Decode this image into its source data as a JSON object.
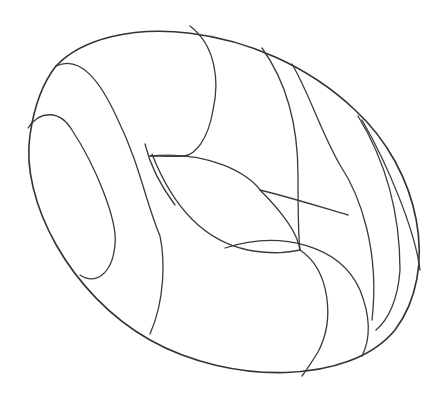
{
  "figure": {
    "stroke_color": "#333333",
    "background": "#ffffff",
    "curves": {
      "outline": "M 56 66 C 110 10, 260 20, 355 110 C 420 170, 440 270, 395 330 C 350 385, 230 385, 150 340 C 70 295, 20 200, 30 135 C 35 100, 45 80, 56 66 Z",
      "hole_left_outer": "M 56 66 C 80 55, 100 80, 118 120 C 140 165, 145 200, 160 236 C 165 260, 165 300, 150 334",
      "hole_left_inner": "M 28 128 C 40 110, 60 110, 72 130 C 95 165, 118 220, 115 245 C 112 275, 95 285, 80 275",
      "top_arc_left": "M 190 26 C 215 45, 220 80, 213 110 C 208 140, 195 155, 184 156 C 170 157, 160 156, 150 156",
      "inner_lens_top": "M 150 156 C 210 150, 250 175, 260 190 C 285 215, 298 235, 300 250",
      "inner_lens_bottom": "M 152 154 C 170 200, 200 240, 248 250 C 275 255, 290 252, 300 250",
      "inner_stub": "M 145 144 C 150 165, 160 185, 175 205",
      "seam_vertical": "M 262 48 C 285 80, 298 120, 298 175 C 298 210, 298 235, 300 250",
      "seam_mid": "M 292 64 C 310 95, 320 130, 340 165 C 360 195, 380 250, 372 320",
      "seam_right_1": "M 358 116 C 385 160, 400 210, 400 270 C 398 300, 388 320, 376 330",
      "seam_right_2": "M 362 120 C 388 165, 415 230, 420 270",
      "arc_lower_left": "M 260 190 C 300 200, 330 210, 348 215",
      "lower_lobe_a": "M 300 250 C 330 270, 335 320, 318 352 C 310 365, 305 372, 302 376",
      "lower_lobe_b": "M 225 248 C 280 230, 340 245, 360 290 C 372 320, 370 340, 362 356"
    }
  }
}
